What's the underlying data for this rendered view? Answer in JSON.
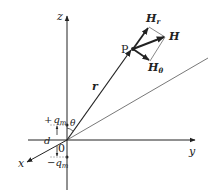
{
  "diagram": {
    "axes": {
      "x_label": "x",
      "y_label": "y",
      "z_label": "z",
      "origin_label": "0"
    },
    "point": {
      "label": "P"
    },
    "vectors": {
      "r_label": "r",
      "H_label": "H",
      "Hr_main": "H",
      "Hr_sub": "r",
      "Htheta_main": "H",
      "Htheta_sub": "θ"
    },
    "charges": {
      "plus_prefix": "+",
      "plus_main": "q",
      "plus_sub": "m",
      "minus_prefix": "−",
      "minus_main": "q",
      "minus_sub": "m",
      "separation_label": "d"
    },
    "angle_label": "θ",
    "colors": {
      "line": "#222222",
      "thin_line": "#555555",
      "background": "#ffffff"
    }
  }
}
